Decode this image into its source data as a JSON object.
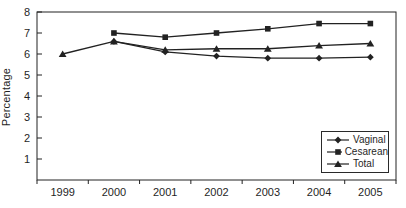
{
  "chart_data": {
    "type": "line",
    "title": "",
    "xlabel": "",
    "ylabel": "Percentage",
    "categories": [
      "1999",
      "2000",
      "2001",
      "2002",
      "2003",
      "2004",
      "2005"
    ],
    "ylim": [
      0,
      8
    ],
    "yticks": [
      1,
      2,
      3,
      4,
      5,
      6,
      7,
      8
    ],
    "grid": false,
    "legend_position": "lower-right",
    "series": [
      {
        "name": "Vaginal",
        "marker": "diamond",
        "values": [
          null,
          6.6,
          6.1,
          5.9,
          5.8,
          5.8,
          5.85
        ]
      },
      {
        "name": "Cesarean",
        "marker": "square",
        "values": [
          null,
          7.0,
          6.8,
          7.0,
          7.2,
          7.45,
          7.45
        ]
      },
      {
        "name": "Total",
        "marker": "triangle",
        "values": [
          6.0,
          6.6,
          6.2,
          6.25,
          6.25,
          6.4,
          6.5
        ]
      }
    ],
    "line_color": "#222222",
    "text_color": "#1f1f1f"
  }
}
